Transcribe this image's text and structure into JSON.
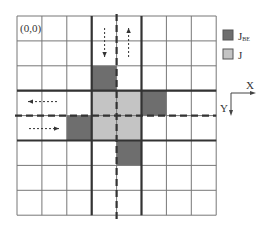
{
  "diagram": {
    "grid": {
      "rows": 8,
      "cols": 8
    },
    "origin_label": "(0,0)",
    "thick_lines": {
      "cols": [
        3,
        5
      ],
      "rows": [
        3,
        5
      ]
    },
    "dashed_lines": {
      "col": 4,
      "row": 4
    },
    "cells_boundary": [
      [
        3,
        2
      ],
      [
        5,
        3
      ],
      [
        2,
        4
      ],
      [
        4,
        5
      ]
    ],
    "cells_interior": [
      [
        3,
        3
      ],
      [
        4,
        3
      ],
      [
        3,
        4
      ],
      [
        4,
        4
      ]
    ],
    "colors": {
      "boundary": "#6e6e6e",
      "interior": "#c4c4c4",
      "line": "#555555"
    },
    "arrows": [
      {
        "name": "arrow-down",
        "direction": "down"
      },
      {
        "name": "arrow-up",
        "direction": "up"
      },
      {
        "name": "arrow-left",
        "direction": "left"
      },
      {
        "name": "arrow-right",
        "direction": "right"
      }
    ]
  },
  "legend": {
    "items": [
      {
        "label": "J",
        "subscript": "BE",
        "color": "#6e6e6e"
      },
      {
        "label": "J",
        "subscript": "",
        "color": "#c4c4c4"
      }
    ]
  },
  "axes": {
    "x_label": "X",
    "y_label": "Y"
  }
}
